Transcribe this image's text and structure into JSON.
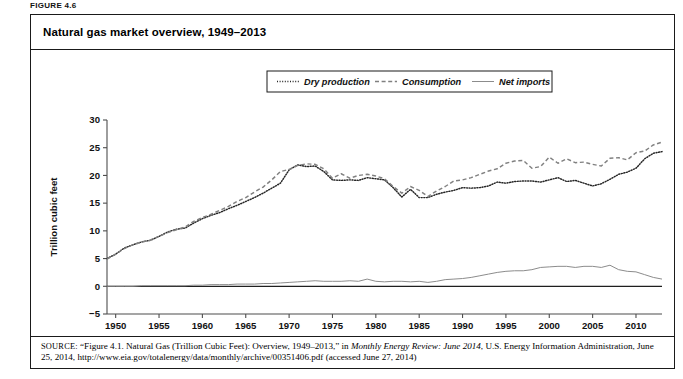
{
  "figure": {
    "label": "FIGURE 4.6",
    "title": "Natural gas market overview, 1949–2013"
  },
  "source": {
    "prefix": "SOURCE:",
    "part1": " “Figure 4.1. Natural Gas (Trillion Cubic Feet): Overview, 1949–2013,” in ",
    "italic1": "Monthly Energy Review: June 2014",
    "part2": ", U.S. Energy Information Administration, June 25, 2014, http://www.eia.gov/totalenergy/data/monthly/archive/00351406.pdf (accessed June 27, 2014)"
  },
  "colors": {
    "ink": "#1a1a1a",
    "axis": "#4d4d4d",
    "series_dry": "#262626",
    "series_consumption": "#808080",
    "series_imports": "#8c8c8c",
    "frame": "#1a1a1a"
  },
  "chart_data": {
    "type": "line",
    "title": "Natural gas market overview, 1949–2013",
    "xlabel": "",
    "ylabel": "Trillion cubic feet",
    "xlim": [
      1949,
      2013
    ],
    "ylim": [
      -5,
      30
    ],
    "grid": false,
    "legend_position": "top-center",
    "xticks": [
      1950,
      1955,
      1960,
      1965,
      1970,
      1975,
      1980,
      1985,
      1990,
      1995,
      2000,
      2005,
      2010
    ],
    "yticks": [
      -5,
      0,
      5,
      10,
      15,
      20,
      25,
      30
    ],
    "x": [
      1949,
      1950,
      1951,
      1952,
      1953,
      1954,
      1955,
      1956,
      1957,
      1958,
      1959,
      1960,
      1961,
      1962,
      1963,
      1964,
      1965,
      1966,
      1967,
      1968,
      1969,
      1970,
      1971,
      1972,
      1973,
      1974,
      1975,
      1976,
      1977,
      1978,
      1979,
      1980,
      1981,
      1982,
      1983,
      1984,
      1985,
      1986,
      1987,
      1988,
      1989,
      1990,
      1991,
      1992,
      1993,
      1994,
      1995,
      1996,
      1997,
      1998,
      1999,
      2000,
      2001,
      2002,
      2003,
      2004,
      2005,
      2006,
      2007,
      2008,
      2009,
      2010,
      2011,
      2012,
      2013
    ],
    "series": [
      {
        "name": "Dry production",
        "style": "dotted",
        "values": [
          5.0,
          5.8,
          6.9,
          7.5,
          8.0,
          8.3,
          9.0,
          9.8,
          10.3,
          10.5,
          11.4,
          12.2,
          12.8,
          13.3,
          14.0,
          14.6,
          15.3,
          16.0,
          16.8,
          17.7,
          18.6,
          21.0,
          21.9,
          21.6,
          21.7,
          20.7,
          19.2,
          19.1,
          19.2,
          19.1,
          19.6,
          19.4,
          19.2,
          17.8,
          16.1,
          17.5,
          16.0,
          16.0,
          16.6,
          17.0,
          17.3,
          17.8,
          17.7,
          17.8,
          18.1,
          18.8,
          18.6,
          18.9,
          19.0,
          19.0,
          18.8,
          19.2,
          19.6,
          18.9,
          19.1,
          18.6,
          18.1,
          18.5,
          19.3,
          20.2,
          20.6,
          21.3,
          23.0,
          24.0,
          24.3
        ]
      },
      {
        "name": "Consumption",
        "style": "dashed",
        "values": [
          4.9,
          5.8,
          6.8,
          7.5,
          8.0,
          8.3,
          9.0,
          9.7,
          10.2,
          10.7,
          11.7,
          12.4,
          13.0,
          13.7,
          14.4,
          15.3,
          16.0,
          17.0,
          17.9,
          19.2,
          20.7,
          21.1,
          21.8,
          22.1,
          22.0,
          21.2,
          19.5,
          20.3,
          19.5,
          20.0,
          20.2,
          19.9,
          19.4,
          18.0,
          16.8,
          18.0,
          17.3,
          16.2,
          17.2,
          18.0,
          19.0,
          19.2,
          19.6,
          20.2,
          20.8,
          21.2,
          22.2,
          22.6,
          22.7,
          21.3,
          21.6,
          23.3,
          22.2,
          23.0,
          22.3,
          22.4,
          22.0,
          21.7,
          23.1,
          23.2,
          22.8,
          24.1,
          24.4,
          25.5,
          26.0
        ]
      },
      {
        "name": "Net imports",
        "style": "solid",
        "values": [
          0.0,
          0.0,
          0.0,
          0.0,
          0.1,
          0.1,
          0.1,
          0.1,
          0.1,
          0.1,
          0.2,
          0.2,
          0.3,
          0.3,
          0.3,
          0.4,
          0.4,
          0.4,
          0.5,
          0.5,
          0.6,
          0.7,
          0.8,
          0.9,
          1.0,
          0.9,
          0.9,
          0.9,
          1.0,
          0.9,
          1.3,
          0.9,
          0.8,
          0.9,
          0.9,
          0.8,
          0.9,
          0.7,
          0.9,
          1.2,
          1.3,
          1.4,
          1.6,
          1.9,
          2.2,
          2.5,
          2.7,
          2.8,
          2.8,
          3.0,
          3.4,
          3.5,
          3.6,
          3.6,
          3.4,
          3.6,
          3.6,
          3.4,
          3.8,
          3.0,
          2.7,
          2.6,
          2.1,
          1.6,
          1.3
        ]
      }
    ]
  },
  "legend": [
    {
      "label": "Dry production",
      "style": "dotted"
    },
    {
      "label": "Consumption",
      "style": "dashed"
    },
    {
      "label": "Net imports",
      "style": "solid"
    }
  ]
}
